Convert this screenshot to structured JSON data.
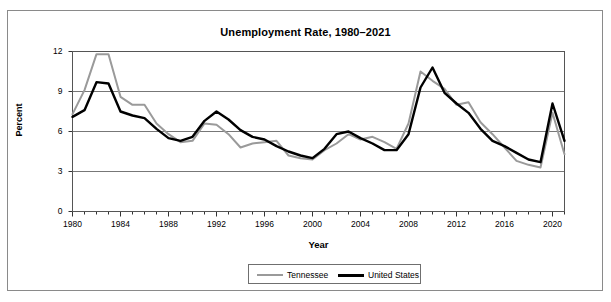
{
  "figure": {
    "title": "Unemployment Rate, 1980–2021",
    "xlabel": "Year",
    "ylabel": "Percent"
  },
  "legend": {
    "entries": [
      {
        "label": "Tennessee",
        "color": "#9a9a9a"
      },
      {
        "label": "United States",
        "color": "#000000"
      }
    ]
  },
  "axis": {
    "y_ticks": [
      "0",
      "3",
      "6",
      "9",
      "12"
    ],
    "x_ticks": [
      "1980",
      "1984",
      "1988",
      "1992",
      "1996",
      "2000",
      "2004",
      "2008",
      "2012",
      "2016",
      "2020"
    ]
  },
  "chart_data": {
    "type": "line",
    "title": "Unemployment Rate, 1980–2021",
    "xlabel": "Year",
    "ylabel": "Percent",
    "xlim": [
      1980,
      2021
    ],
    "ylim": [
      0,
      12
    ],
    "y_ticks": [
      0,
      3,
      6,
      9,
      12
    ],
    "x_ticks": [
      1980,
      1984,
      1988,
      1992,
      1996,
      2000,
      2004,
      2008,
      2012,
      2016,
      2020
    ],
    "grid": "horizontal",
    "legend_position": "bottom-center",
    "x": [
      1980,
      1981,
      1982,
      1983,
      1984,
      1985,
      1986,
      1987,
      1988,
      1989,
      1990,
      1991,
      1992,
      1993,
      1994,
      1995,
      1996,
      1997,
      1998,
      1999,
      2000,
      2001,
      2002,
      2003,
      2004,
      2005,
      2006,
      2007,
      2008,
      2009,
      2010,
      2011,
      2012,
      2013,
      2014,
      2015,
      2016,
      2017,
      2018,
      2019,
      2020,
      2021
    ],
    "series": [
      {
        "name": "Tennessee",
        "color": "#9a9a9a",
        "values": [
          7.3,
          9.1,
          11.8,
          11.8,
          8.6,
          8.0,
          8.0,
          6.6,
          5.8,
          5.2,
          5.3,
          6.6,
          6.5,
          5.8,
          4.8,
          5.1,
          5.2,
          5.3,
          4.2,
          4.0,
          3.9,
          4.6,
          5.1,
          5.8,
          5.4,
          5.6,
          5.2,
          4.7,
          6.6,
          10.5,
          9.8,
          9.2,
          8.0,
          8.2,
          6.7,
          5.8,
          4.8,
          3.8,
          3.5,
          3.3,
          7.4,
          4.3
        ]
      },
      {
        "name": "United States",
        "color": "#000000",
        "values": [
          7.1,
          7.6,
          9.7,
          9.6,
          7.5,
          7.2,
          7.0,
          6.2,
          5.5,
          5.3,
          5.6,
          6.8,
          7.5,
          6.9,
          6.1,
          5.6,
          5.4,
          4.9,
          4.5,
          4.2,
          4.0,
          4.7,
          5.8,
          6.0,
          5.5,
          5.1,
          4.6,
          4.6,
          5.8,
          9.3,
          10.8,
          8.9,
          8.1,
          7.4,
          6.2,
          5.3,
          4.9,
          4.4,
          3.9,
          3.7,
          8.1,
          5.3
        ]
      }
    ]
  }
}
